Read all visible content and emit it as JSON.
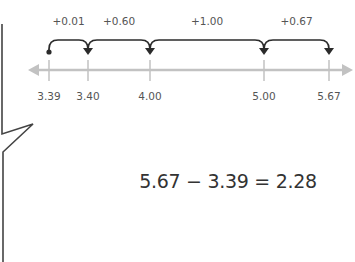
{
  "diagram": {
    "type": "number-line-subtraction",
    "start_value": 3.39,
    "tick_values": [
      3.39,
      3.4,
      4.0,
      5.0,
      5.67
    ],
    "tick_labels": [
      "3.39",
      "3.40",
      "4.00",
      "5.00",
      "5.67"
    ],
    "jumps": [
      {
        "from": 3.39,
        "to": 3.4,
        "label": "+0.01"
      },
      {
        "from": 3.4,
        "to": 4.0,
        "label": "+0.60"
      },
      {
        "from": 4.0,
        "to": 5.0,
        "label": "+1.00"
      },
      {
        "from": 5.0,
        "to": 5.67,
        "label": "+0.67"
      }
    ],
    "equation": "5.67 − 3.39 = 2.28",
    "colors": {
      "axis": "#c2c2c2",
      "arc": "#2b2b2b",
      "label": "#555555",
      "equation": "#333333",
      "bubble": "#444444"
    }
  }
}
